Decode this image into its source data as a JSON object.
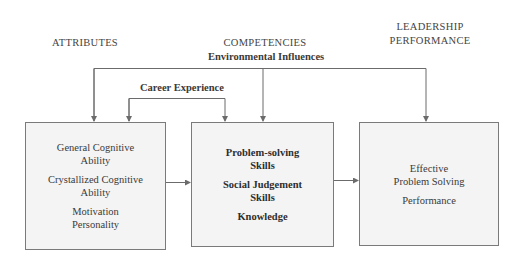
{
  "diagram": {
    "columns": [
      {
        "id": "attributes",
        "heading": "ATTRIBUTES"
      },
      {
        "id": "competencies",
        "heading": "COMPETENCIES"
      },
      {
        "id": "performance",
        "heading_lines": [
          "LEADERSHIP",
          "PERFORMANCE"
        ]
      }
    ],
    "influences": {
      "environmental": "Environmental Influences",
      "career": "Career Experience"
    },
    "boxes": {
      "attributes": {
        "items": [
          [
            "General Cognitive",
            "Ability"
          ],
          [
            "Crystallized Cognitive",
            "Ability"
          ],
          [
            "Motivation",
            "Personality"
          ]
        ]
      },
      "competencies": {
        "items": [
          [
            "Problem-solving",
            "Skills"
          ],
          [
            "Social Judgement",
            "Skills"
          ],
          [
            "Knowledge"
          ]
        ]
      },
      "performance": {
        "items": [
          [
            "Effective",
            "Problem Solving"
          ],
          [
            "Performance"
          ]
        ]
      }
    },
    "edges": [
      {
        "from": "Environmental Influences",
        "to": "attributes"
      },
      {
        "from": "Environmental Influences",
        "to": "competencies"
      },
      {
        "from": "Environmental Influences",
        "to": "performance"
      },
      {
        "from": "Career Experience",
        "to": "attributes"
      },
      {
        "from": "Career Experience",
        "to": "competencies"
      },
      {
        "from": "attributes",
        "to": "competencies"
      },
      {
        "from": "competencies",
        "to": "performance"
      }
    ],
    "colors": {
      "line": "#6b6b6b",
      "box_fill": "#f4f4f4",
      "box_border": "#7a7a7a",
      "text": "#3a3a3a"
    }
  }
}
